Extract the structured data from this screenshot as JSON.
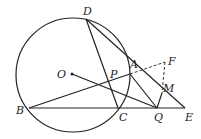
{
  "diagram": {
    "type": "geometry",
    "circle": {
      "cx": 73,
      "cy": 75,
      "r": 57
    },
    "points": [
      {
        "id": "O",
        "x": 72,
        "y": 74,
        "lx": 57,
        "ly": 78
      },
      {
        "id": "D",
        "x": 86,
        "y": 19,
        "lx": 83,
        "ly": 15
      },
      {
        "id": "A",
        "x": 130,
        "y": 74,
        "lx": 130,
        "ly": 68
      },
      {
        "id": "P",
        "x": 109,
        "y": 81,
        "lx": 110,
        "ly": 78
      },
      {
        "id": "B",
        "x": 29,
        "y": 108,
        "lx": 16,
        "ly": 114
      },
      {
        "id": "C",
        "x": 118,
        "y": 108,
        "lx": 119,
        "ly": 121
      },
      {
        "id": "Q",
        "x": 157,
        "y": 108,
        "lx": 154,
        "ly": 121
      },
      {
        "id": "E",
        "x": 185,
        "y": 108,
        "lx": 185,
        "ly": 121
      },
      {
        "id": "F",
        "x": 165,
        "y": 62,
        "lx": 168,
        "ly": 65
      },
      {
        "id": "M",
        "x": 162,
        "y": 93,
        "lx": 163,
        "ly": 92
      }
    ]
  }
}
